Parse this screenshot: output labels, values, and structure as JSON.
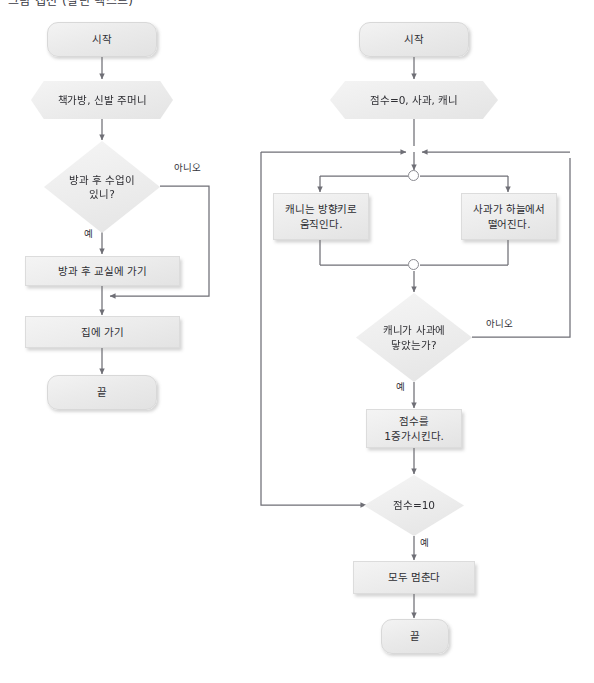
{
  "page": {
    "top_cropped_text": "그림 캡션 (잘린 텍스트)",
    "width": 594,
    "height": 683,
    "background": "#ffffff",
    "line_color": "#6f6f76",
    "node_fill": "#ececec",
    "node_border": "#dcdcdc",
    "text_color": "#2e2e33"
  },
  "left_flowchart": {
    "name": "방과 후 일과 순서도",
    "nodes": [
      {
        "id": "l-start",
        "type": "terminator",
        "label": "시작"
      },
      {
        "id": "l-input",
        "type": "hexagon",
        "label": "책가방, 신발 주머니"
      },
      {
        "id": "l-decision",
        "type": "decision",
        "label": "방과 후 수업이\n있니?"
      },
      {
        "id": "l-class",
        "type": "process",
        "label": "방과 후 교실에 가기"
      },
      {
        "id": "l-home",
        "type": "process",
        "label": "집에 가기"
      },
      {
        "id": "l-end",
        "type": "terminator",
        "label": "끝"
      }
    ],
    "edge_labels": [
      {
        "id": "l-no",
        "label": "아니오"
      },
      {
        "id": "l-yes",
        "label": "예"
      }
    ]
  },
  "right_flowchart": {
    "name": "사과 받기 게임 순서도",
    "nodes": [
      {
        "id": "r-start",
        "type": "terminator",
        "label": "시작"
      },
      {
        "id": "r-init",
        "type": "hexagon",
        "label": "점수=0, 사과, 캐니"
      },
      {
        "id": "r-canny",
        "type": "process",
        "label": "캐니는 방향키로\n움직인다."
      },
      {
        "id": "r-apple",
        "type": "process",
        "label": "사과가 하늘에서\n떨어진다."
      },
      {
        "id": "r-touch",
        "type": "decision",
        "label": "캐니가 사과에\n닿았는가?"
      },
      {
        "id": "r-score-up",
        "type": "process",
        "label": "점수를\n1증가시킨다."
      },
      {
        "id": "r-score-ten",
        "type": "decision",
        "label": "점수=10"
      },
      {
        "id": "r-stop",
        "type": "process",
        "label": "모두 멈춘다"
      },
      {
        "id": "r-end",
        "type": "terminator",
        "label": "끝"
      }
    ],
    "edge_labels": [
      {
        "id": "r-no",
        "label": "아니오"
      },
      {
        "id": "r-yes",
        "label": "예"
      },
      {
        "id": "r-yes-ten",
        "label": "예"
      }
    ],
    "connectors": [
      {
        "id": "fork-dot",
        "type": "fork-circle"
      },
      {
        "id": "join-dot",
        "type": "join-circle"
      }
    ]
  }
}
